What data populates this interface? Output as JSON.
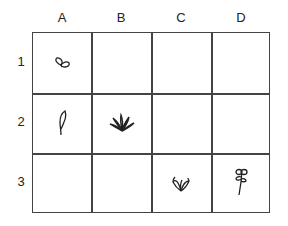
{
  "columns": [
    "A",
    "B",
    "C",
    "D"
  ],
  "rows": [
    "1",
    "2",
    "3"
  ],
  "cells": [
    {
      "col": "A",
      "row": "1",
      "icon": "sprout-icon"
    },
    {
      "col": "A",
      "row": "2",
      "icon": "leaf-icon"
    },
    {
      "col": "B",
      "row": "2",
      "icon": "grass-tuft-icon"
    },
    {
      "col": "C",
      "row": "3",
      "icon": "seedling-icon"
    },
    {
      "col": "D",
      "row": "3",
      "icon": "flower-icon"
    }
  ],
  "colors": {
    "line": "#444444",
    "text": "#222222",
    "background": "#ffffff"
  }
}
